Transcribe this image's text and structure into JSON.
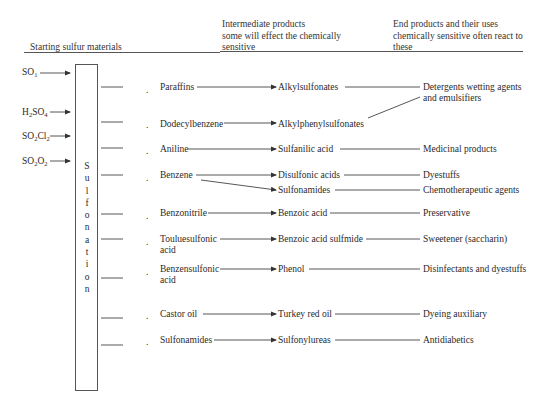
{
  "headers": {
    "starting": "Starting sulfur materials",
    "intermediate": [
      "Intermediate products",
      "some will effect the chemically",
      "sensitive"
    ],
    "end": [
      "End products and their uses",
      "chemically sensitive often react to",
      "these"
    ]
  },
  "starting_materials": [
    {
      "base": "SO",
      "sub": "1",
      "rest": "",
      "sub2": ""
    },
    {
      "base": "H",
      "sub": "2",
      "rest": "SO",
      "sub2": "4"
    },
    {
      "base": "SO",
      "sub": "2",
      "rest": "Cl",
      "sub2": "2"
    },
    {
      "base": "SO",
      "sub": "2",
      "rest": "O",
      "sub2": "2"
    }
  ],
  "process_label": "Sulfonation",
  "process_letters": [
    "S",
    "u",
    "l",
    "f",
    "o",
    "n",
    "a",
    "t",
    "i",
    "o",
    "n"
  ],
  "rows": [
    {
      "reactant": "Paraffins",
      "reactant2": "",
      "intermediate": "Alkylsulfonates",
      "end": "Detergents wetting agents",
      "end2": "and emulsifiers"
    },
    {
      "reactant": "Dodecylbenzene",
      "reactant2": "",
      "intermediate": "Alkylphenylsulfonates",
      "end": "",
      "end2": ""
    },
    {
      "reactant": "Aniline",
      "reactant2": "",
      "intermediate": "Sulfanilic acid",
      "end": "Medicinal products",
      "end2": ""
    },
    {
      "reactant": "Benzene",
      "reactant2": "",
      "intermediate": "Disulfonic acids",
      "end": "Dyestuffs",
      "end2": ""
    },
    {
      "reactant": "",
      "reactant2": "",
      "intermediate": "Sulfonamides",
      "end": "Chemotherapeutic agents",
      "end2": ""
    },
    {
      "reactant": "Benzonitrile",
      "reactant2": "",
      "intermediate": "Benzoic acid",
      "end": "Preservative",
      "end2": ""
    },
    {
      "reactant": "Touluesulfonic",
      "reactant2": "acid",
      "intermediate": "Benzoic acid sulfmide",
      "end": "Sweetener (saccharin)",
      "end2": ""
    },
    {
      "reactant": "Benzensulfonic",
      "reactant2": "acid",
      "intermediate": "Phenol",
      "end": "Disinfectants and dyestuffs",
      "end2": ""
    },
    {
      "reactant": "Castor oil",
      "reactant2": "",
      "intermediate": "Turkey red oil",
      "end": "Dyeing auxiliary",
      "end2": ""
    },
    {
      "reactant": "Sulfonamides",
      "reactant2": "",
      "intermediate": "Sulfonylureas",
      "end": "Antidiabetics",
      "end2": ""
    }
  ],
  "bullet": "."
}
